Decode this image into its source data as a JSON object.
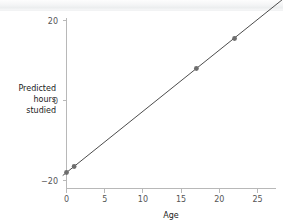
{
  "chart_data": {
    "type": "scatter",
    "title": "",
    "xlabel": "Age",
    "ylabel": "Predicted hours studied",
    "ylabel_lines": [
      "Predicted",
      "hours",
      "studied"
    ],
    "x": [
      0,
      1,
      17,
      22
    ],
    "values": [
      -18,
      -16.5,
      8,
      15.5
    ],
    "series": [
      {
        "name": "Predicted hours studied",
        "x": [
          0,
          1,
          17,
          22
        ],
        "values": [
          -18,
          -16.5,
          8,
          15.5
        ]
      }
    ],
    "fit_line": {
      "type": "line",
      "slope": 1.53,
      "intercept": -18,
      "x": [
        -0.5,
        28.5
      ],
      "values": [
        -18.77,
        25.6
      ]
    },
    "xlim": [
      -1.5,
      28.5
    ],
    "ylim": [
      -23,
      23
    ],
    "xticks": [
      0,
      5,
      10,
      15,
      20,
      25
    ],
    "xtick_labels": [
      "0",
      "5",
      "10",
      "15",
      "20",
      "25"
    ],
    "yticks": [
      -20,
      0,
      20
    ],
    "ytick_labels": [
      "−20",
      "0",
      "20"
    ],
    "grid": false,
    "legend": false,
    "colors": {
      "point": "#6e6e6e",
      "line": "#4c4c4c",
      "axis": "#b8b8b8",
      "tick_text": "#555555",
      "label_text": "#1a1a1a",
      "background": "#ffffff"
    }
  }
}
